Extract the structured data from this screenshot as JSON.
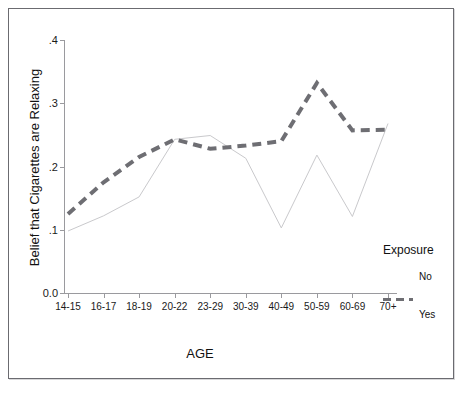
{
  "chart_data": {
    "type": "line",
    "title": "",
    "xlabel": "AGE",
    "ylabel": "Belief that Cigarettes are Relaxing",
    "categories": [
      "14-15",
      "16-17",
      "18-19",
      "20-22",
      "23-29",
      "30-39",
      "40-49",
      "50-59",
      "60-69",
      "70+"
    ],
    "ytick_labels": [
      "0.0",
      ".1",
      ".2",
      ".3",
      ".4"
    ],
    "ytick_values": [
      0.0,
      0.1,
      0.2,
      0.3,
      0.4
    ],
    "ylim": [
      0.0,
      0.4
    ],
    "grid": false,
    "legend_position": "right",
    "legend_title": "Exposure",
    "series": [
      {
        "name": "No",
        "style": "solid-thin",
        "color": "#c9c9cc",
        "values": [
          0.098,
          0.122,
          0.152,
          0.243,
          0.249,
          0.213,
          0.103,
          0.218,
          0.121,
          0.268
        ]
      },
      {
        "name": "Yes",
        "style": "dashed-thick",
        "color": "#6e6e73",
        "values": [
          0.125,
          0.175,
          0.215,
          0.243,
          0.228,
          0.233,
          0.24,
          0.332,
          0.257,
          0.258
        ]
      }
    ]
  },
  "legend": {
    "title": "Exposure",
    "entries": [
      {
        "label": "No"
      },
      {
        "label": "Yes"
      }
    ]
  },
  "axes": {
    "x_title": "AGE",
    "y_title": "Belief that Cigarettes are Relaxing"
  }
}
